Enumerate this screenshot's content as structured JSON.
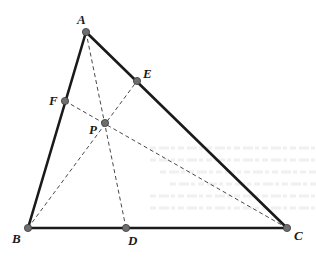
{
  "diagram": {
    "type": "geometry-triangle-cevians",
    "colors": {
      "background": "#ffffff",
      "solid_line": "#1a1a1a",
      "dashed_line": "#333333",
      "point_fill": "#6e6e6e",
      "point_stroke": "#3a3a3a",
      "label": "#1a1a1a",
      "bleed_text": "#e4e4e4"
    },
    "points": [
      {
        "id": "A",
        "label": "A",
        "x": 86,
        "y": 32,
        "label_x": 77,
        "label_y": 24
      },
      {
        "id": "B",
        "label": "B",
        "x": 28,
        "y": 228,
        "label_x": 12,
        "label_y": 243
      },
      {
        "id": "C",
        "label": "C",
        "x": 287,
        "y": 228,
        "label_x": 294,
        "label_y": 240
      },
      {
        "id": "D",
        "label": "D",
        "x": 126,
        "y": 228,
        "label_x": 128,
        "label_y": 245
      },
      {
        "id": "E",
        "label": "E",
        "x": 137,
        "y": 81,
        "label_x": 143,
        "label_y": 78
      },
      {
        "id": "F",
        "label": "F",
        "x": 65,
        "y": 101,
        "label_x": 49,
        "label_y": 105
      },
      {
        "id": "P",
        "label": "P",
        "x": 105,
        "y": 123,
        "label_x": 89,
        "label_y": 134
      }
    ],
    "solid_segments": [
      {
        "id": "AB",
        "from": "A",
        "to": "B"
      },
      {
        "id": "AC",
        "from": "A",
        "to": "C"
      },
      {
        "id": "BC",
        "from": "B",
        "to": "C"
      }
    ],
    "dashed_segments": [
      {
        "id": "AD",
        "from": "A",
        "to": "D"
      },
      {
        "id": "BE",
        "from": "B",
        "to": "E"
      },
      {
        "id": "CF",
        "from": "C",
        "to": "F"
      }
    ]
  }
}
